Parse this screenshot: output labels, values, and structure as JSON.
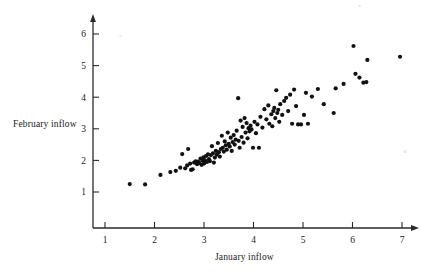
{
  "chart_data": {
    "type": "scatter",
    "title": "",
    "xlabel": "January inflow",
    "ylabel": "February inflow",
    "xlim": [
      0.6,
      7.4
    ],
    "ylim": [
      0.55,
      6.45
    ],
    "xticks": [
      1,
      2,
      3,
      4,
      5,
      6,
      7
    ],
    "yticks": [
      1,
      2,
      3,
      4,
      5,
      6
    ],
    "xtick_labels": [
      "1",
      "2",
      "3",
      "4",
      "5",
      "6",
      "7"
    ],
    "ytick_labels": [
      "1",
      "2",
      "3",
      "4",
      "5",
      "6"
    ],
    "grid": false,
    "legend": false,
    "legend_position": "none",
    "marker": {
      "shape": "circle",
      "color": "#111111",
      "size_px": 4.2
    },
    "axis_style": {
      "color": "#2a2a2a",
      "arrow_heads": true,
      "spines": [
        "left",
        "bottom"
      ]
    },
    "n_points": 124,
    "annotations": [],
    "points": [
      [
        1.5,
        1.25
      ],
      [
        1.81,
        1.24
      ],
      [
        2.12,
        1.54
      ],
      [
        2.32,
        1.63
      ],
      [
        2.43,
        1.67
      ],
      [
        2.52,
        1.77
      ],
      [
        2.56,
        2.2
      ],
      [
        2.62,
        1.75
      ],
      [
        2.66,
        1.84
      ],
      [
        2.68,
        2.36
      ],
      [
        2.72,
        1.9
      ],
      [
        2.74,
        1.7
      ],
      [
        2.77,
        1.72
      ],
      [
        2.8,
        1.93
      ],
      [
        2.83,
        1.97
      ],
      [
        2.86,
        1.88
      ],
      [
        2.88,
        1.96
      ],
      [
        2.9,
        1.92
      ],
      [
        2.93,
        2.06
      ],
      [
        2.95,
        1.86
      ],
      [
        2.97,
        1.99
      ],
      [
        2.99,
        2.1
      ],
      [
        3.0,
        1.9
      ],
      [
        3.02,
        2.0
      ],
      [
        3.04,
        2.14
      ],
      [
        3.06,
        1.95
      ],
      [
        3.08,
        2.19
      ],
      [
        3.1,
        2.04
      ],
      [
        3.12,
        1.98
      ],
      [
        3.14,
        2.17
      ],
      [
        3.16,
        2.45
      ],
      [
        3.18,
        2.22
      ],
      [
        3.2,
        1.93
      ],
      [
        3.22,
        2.09
      ],
      [
        3.24,
        2.3
      ],
      [
        3.26,
        2.18
      ],
      [
        3.28,
        2.55
      ],
      [
        3.3,
        2.26
      ],
      [
        3.32,
        2.12
      ],
      [
        3.34,
        2.36
      ],
      [
        3.36,
        2.78
      ],
      [
        3.38,
        2.4
      ],
      [
        3.4,
        2.28
      ],
      [
        3.42,
        2.6
      ],
      [
        3.44,
        2.48
      ],
      [
        3.46,
        2.34
      ],
      [
        3.48,
        2.88
      ],
      [
        3.5,
        2.52
      ],
      [
        3.52,
        2.44
      ],
      [
        3.54,
        2.72
      ],
      [
        3.56,
        2.3
      ],
      [
        3.58,
        2.58
      ],
      [
        3.6,
        2.8
      ],
      [
        3.62,
        2.5
      ],
      [
        3.64,
        2.66
      ],
      [
        3.66,
        2.94
      ],
      [
        3.69,
        3.97
      ],
      [
        3.7,
        2.62
      ],
      [
        3.72,
        2.4
      ],
      [
        3.74,
        3.26
      ],
      [
        3.76,
        2.74
      ],
      [
        3.78,
        3.06
      ],
      [
        3.8,
        2.56
      ],
      [
        3.82,
        3.34
      ],
      [
        3.84,
        2.88
      ],
      [
        3.86,
        3.18
      ],
      [
        3.88,
        2.7
      ],
      [
        3.9,
        3.02
      ],
      [
        3.92,
        2.92
      ],
      [
        3.94,
        3.1
      ],
      [
        3.96,
        2.98
      ],
      [
        3.99,
        2.4
      ],
      [
        4.02,
        3.22
      ],
      [
        4.05,
        2.86
      ],
      [
        4.08,
        3.14
      ],
      [
        4.11,
        2.4
      ],
      [
        4.14,
        3.38
      ],
      [
        4.18,
        3.04
      ],
      [
        4.22,
        3.62
      ],
      [
        4.26,
        3.3
      ],
      [
        4.3,
        3.74
      ],
      [
        4.32,
        3.16
      ],
      [
        4.36,
        3.46
      ],
      [
        4.38,
        3.08
      ],
      [
        4.4,
        3.56
      ],
      [
        4.42,
        3.66
      ],
      [
        4.44,
        3.34
      ],
      [
        4.46,
        4.22
      ],
      [
        4.48,
        3.5
      ],
      [
        4.5,
        3.6
      ],
      [
        4.52,
        3.22
      ],
      [
        4.54,
        3.78
      ],
      [
        4.58,
        3.44
      ],
      [
        4.62,
        3.88
      ],
      [
        4.66,
        3.98
      ],
      [
        4.7,
        3.56
      ],
      [
        4.74,
        4.08
      ],
      [
        4.78,
        3.16
      ],
      [
        4.82,
        4.24
      ],
      [
        4.86,
        3.72
      ],
      [
        4.9,
        3.14
      ],
      [
        4.96,
        3.14
      ],
      [
        5.02,
        3.44
      ],
      [
        5.06,
        4.14
      ],
      [
        5.1,
        3.16
      ],
      [
        5.18,
        4.02
      ],
      [
        5.3,
        4.26
      ],
      [
        5.42,
        3.78
      ],
      [
        5.62,
        3.5
      ],
      [
        5.66,
        4.28
      ],
      [
        5.82,
        4.42
      ],
      [
        6.02,
        5.62
      ],
      [
        6.06,
        4.74
      ],
      [
        6.14,
        4.62
      ],
      [
        6.22,
        4.46
      ],
      [
        6.28,
        4.48
      ],
      [
        6.3,
        5.18
      ],
      [
        6.96,
        5.28
      ]
    ]
  },
  "labels": {
    "ylabel": "February inflow",
    "xlabel": "January inflow"
  }
}
